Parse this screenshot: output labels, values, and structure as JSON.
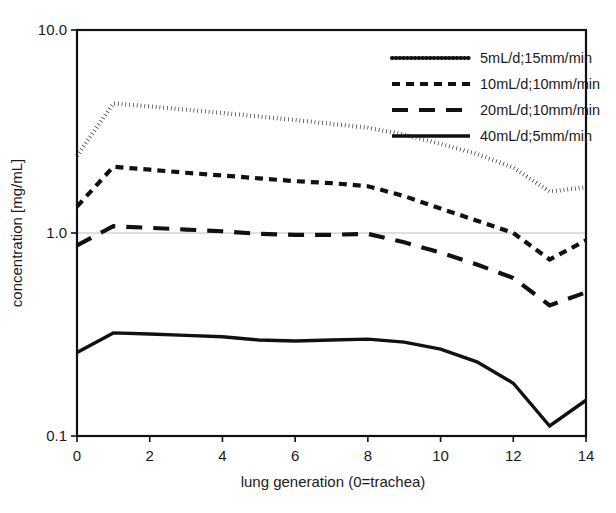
{
  "chart_data": {
    "type": "line",
    "title": "",
    "xlabel": "lung generation (0=trachea)",
    "ylabel": "concentration [mg/mL]",
    "yscale": "log",
    "ylim": [
      0.1,
      10.0
    ],
    "xlim": [
      0,
      14
    ],
    "grid": "horizontal-at-1.0",
    "legend_position": "top-right",
    "y_ticks": [
      "0.1",
      "1.0",
      "10.0"
    ],
    "y_tick_values": [
      0.1,
      1.0,
      10.0
    ],
    "x_ticks": [
      "0",
      "2",
      "4",
      "6",
      "8",
      "10",
      "12",
      "14"
    ],
    "x_tick_values": [
      0,
      2,
      4,
      6,
      8,
      10,
      12,
      14
    ],
    "x": [
      0,
      1,
      2,
      3,
      4,
      5,
      6,
      7,
      8,
      9,
      10,
      11,
      12,
      13,
      14
    ],
    "series": [
      {
        "name": "5mL/d;15mm/min",
        "dash": "dotted",
        "values": [
          2.4,
          4.35,
          4.2,
          4.05,
          3.9,
          3.75,
          3.6,
          3.45,
          3.3,
          3.05,
          2.75,
          2.45,
          2.1,
          1.6,
          1.68
        ]
      },
      {
        "name": "10mL/d;10mm/min",
        "dash": "dashed",
        "values": [
          1.35,
          2.12,
          2.05,
          1.98,
          1.92,
          1.86,
          1.8,
          1.76,
          1.7,
          1.52,
          1.32,
          1.15,
          1.0,
          0.74,
          0.92
        ]
      },
      {
        "name": "20mL/d;10mm/min",
        "dash": "long-dashed",
        "values": [
          0.87,
          1.08,
          1.06,
          1.04,
          1.02,
          0.99,
          0.98,
          0.98,
          0.99,
          0.9,
          0.8,
          0.7,
          0.6,
          0.44,
          0.51
        ]
      },
      {
        "name": "40mL/d;5mm/min",
        "dash": "solid",
        "values": [
          0.258,
          0.322,
          0.318,
          0.313,
          0.308,
          0.297,
          0.294,
          0.297,
          0.3,
          0.29,
          0.268,
          0.232,
          0.182,
          0.112,
          0.15
        ]
      }
    ]
  },
  "legend": {
    "items": [
      {
        "label": "5mL/d;15mm/min"
      },
      {
        "label": "10mL/d;10mm/min"
      },
      {
        "label": "20mL/d;10mm/min"
      },
      {
        "label": "40mL/d;5mm/min"
      }
    ]
  },
  "colors": {
    "line": "#111111",
    "frame": "#111111",
    "grid": "#b9b9b9",
    "background": "#ffffff"
  }
}
